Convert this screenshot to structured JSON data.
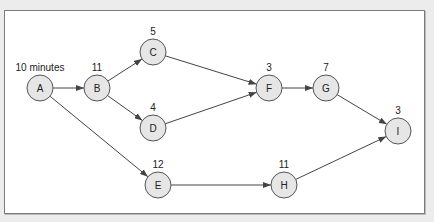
{
  "diagram": {
    "type": "activity-on-node network",
    "nodes": [
      {
        "id": "A",
        "label": "A",
        "duration": "10 minutes",
        "x": 40,
        "y": 88
      },
      {
        "id": "B",
        "label": "B",
        "duration": "11",
        "x": 97,
        "y": 88
      },
      {
        "id": "C",
        "label": "C",
        "duration": "5",
        "x": 153,
        "y": 52
      },
      {
        "id": "D",
        "label": "D",
        "duration": "4",
        "x": 153,
        "y": 128
      },
      {
        "id": "E",
        "label": "E",
        "duration": "12",
        "x": 158,
        "y": 185
      },
      {
        "id": "F",
        "label": "F",
        "duration": "3",
        "x": 269,
        "y": 88
      },
      {
        "id": "G",
        "label": "G",
        "duration": "7",
        "x": 326,
        "y": 88
      },
      {
        "id": "H",
        "label": "H",
        "duration": "11",
        "x": 284,
        "y": 185
      },
      {
        "id": "I",
        "label": "I",
        "duration": "3",
        "x": 398,
        "y": 131
      }
    ],
    "edges": [
      [
        "A",
        "B"
      ],
      [
        "A",
        "E"
      ],
      [
        "B",
        "C"
      ],
      [
        "B",
        "D"
      ],
      [
        "C",
        "F"
      ],
      [
        "D",
        "F"
      ],
      [
        "F",
        "G"
      ],
      [
        "G",
        "I"
      ],
      [
        "E",
        "H"
      ],
      [
        "H",
        "I"
      ]
    ]
  }
}
